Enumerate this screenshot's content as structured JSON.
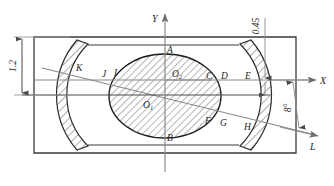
{
  "figure": {
    "type": "engineering-cross-section-drawing",
    "background": "#ffffff",
    "outline_color": "#3a3a3a",
    "thin_color": "#8a8a8a",
    "hatch_color": "#4a4a4a",
    "width": 334,
    "height": 186
  },
  "axes": {
    "x_label": "X",
    "y_label": "Y",
    "l_label": "L",
    "origin_x": 165,
    "origin_y": 80
  },
  "dimensions": [
    {
      "name": "height-dimension",
      "text": "1.2",
      "orientation": "vertical",
      "side": "left"
    },
    {
      "name": "offset-dimension",
      "text": "0.45",
      "orientation": "vertical",
      "side": "right"
    },
    {
      "name": "angle-dimension",
      "text": "8°",
      "orientation": "vertical",
      "side": "right"
    }
  ],
  "points": [
    {
      "id": "A",
      "x": 170,
      "y": 50
    },
    {
      "id": "B",
      "x": 170,
      "y": 136
    },
    {
      "id": "C",
      "x": 210,
      "y": 76
    },
    {
      "id": "D",
      "x": 225,
      "y": 75
    },
    {
      "id": "E",
      "x": 248,
      "y": 76
    },
    {
      "id": "F",
      "x": 209,
      "y": 121
    },
    {
      "id": "G",
      "x": 224,
      "y": 123
    },
    {
      "id": "H",
      "x": 247,
      "y": 127
    },
    {
      "id": "I",
      "x": 116,
      "y": 73
    },
    {
      "id": "J",
      "x": 104,
      "y": 74
    },
    {
      "id": "K",
      "x": 79,
      "y": 68
    },
    {
      "id": "O1",
      "x": 148,
      "y": 104
    },
    {
      "id": "O2",
      "x": 177,
      "y": 74
    }
  ],
  "labels": {
    "A": "A",
    "B": "B",
    "C": "C",
    "D": "D",
    "E": "E",
    "F": "F",
    "G": "G",
    "H": "H",
    "I": "I",
    "J": "J",
    "K": "K",
    "O1": "O",
    "O1sub": "1",
    "O2": "O",
    "O2sub": "2"
  }
}
